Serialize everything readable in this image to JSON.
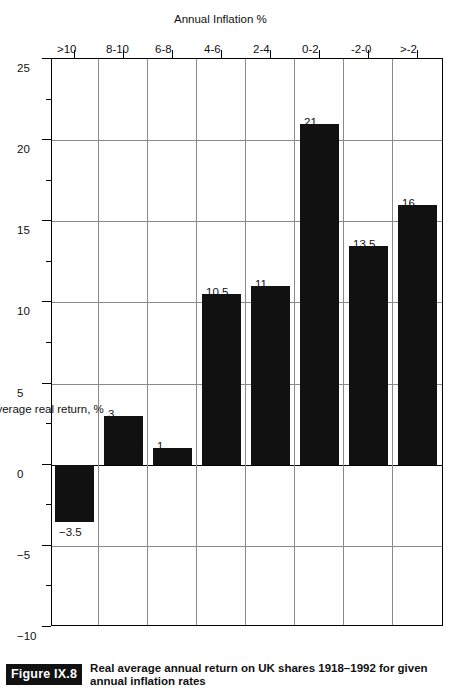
{
  "figure": {
    "tag": "Figure IX.8",
    "caption": "Real average annual return on UK shares 1918–1992 for given annual inflation rates"
  },
  "chart_data": {
    "type": "bar",
    "orientation": "horizontal",
    "title": "",
    "xlabel": "Annual Inflation %",
    "ylabel": "Average real return, %",
    "categories": [
      ">-2",
      "-2-0",
      "0-2",
      "2-4",
      "4-6",
      "6-8",
      "8-10",
      ">10"
    ],
    "values": [
      16,
      13.5,
      21,
      11,
      10.5,
      1,
      3,
      -3.5
    ],
    "value_labels": [
      "16",
      "13.5",
      "21",
      "11",
      "10.5",
      "1",
      "3",
      "−3.5"
    ],
    "ylim": [
      -10,
      25
    ],
    "value_ticks": [
      25,
      20,
      15,
      10,
      5,
      0,
      -5,
      -10
    ],
    "value_tick_labels": [
      "25",
      "20",
      "15",
      "10",
      "5",
      "0",
      "−5",
      "−10"
    ],
    "minor_tick_step": 2.5,
    "grid": "value-axis gridlines at major ticks",
    "legend": "none",
    "bar_color": "#111111",
    "grid_color": "#8a8a8a",
    "axis_color": "#000000"
  },
  "axis": {
    "value_axis_title": "Average real return, %",
    "category_axis_title": "Annual Inflation %"
  }
}
